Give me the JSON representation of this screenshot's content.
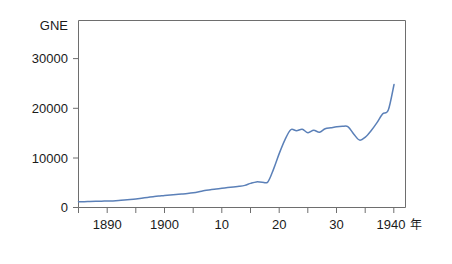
{
  "chart_data": {
    "type": "line",
    "title": "",
    "subtitle": "",
    "ylabel": "GNE",
    "xlabel": "年",
    "x_unit_label": "年",
    "xlim": [
      1885,
      1942
    ],
    "ylim": [
      0,
      38000
    ],
    "grid": false,
    "legend": null,
    "legend_position": "none",
    "y_ticks": [
      0,
      10000,
      20000,
      30000
    ],
    "y_tick_labels": [
      "0",
      "10000",
      "20000",
      "30000"
    ],
    "x_ticks": [
      1890,
      1895,
      1900,
      1905,
      1910,
      1915,
      1920,
      1925,
      1930,
      1935,
      1940
    ],
    "x_tick_labels": [
      "1890",
      "",
      "1900",
      "",
      "10",
      "",
      "20",
      "",
      "30",
      "",
      "1940"
    ],
    "x_labeled_ticks": [
      1890,
      1900,
      1910,
      1920,
      1930,
      1940
    ],
    "x_labeled_text": [
      "1890",
      "1900",
      "10",
      "20",
      "30",
      "1940"
    ],
    "line_color": "#5b80b8",
    "axis_color": "#6e6e6e",
    "series": [
      {
        "name": "GNE",
        "x": [
          1885,
          1886,
          1887,
          1888,
          1889,
          1890,
          1891,
          1892,
          1893,
          1894,
          1895,
          1896,
          1897,
          1898,
          1899,
          1900,
          1901,
          1902,
          1903,
          1904,
          1905,
          1906,
          1907,
          1908,
          1909,
          1910,
          1911,
          1912,
          1913,
          1914,
          1915,
          1916,
          1917,
          1918,
          1919,
          1920,
          1921,
          1922,
          1923,
          1924,
          1925,
          1926,
          1927,
          1928,
          1929,
          1930,
          1931,
          1932,
          1933,
          1934,
          1935,
          1936,
          1937,
          1938,
          1939,
          1940
        ],
        "values": [
          1150,
          1180,
          1220,
          1260,
          1290,
          1320,
          1340,
          1400,
          1500,
          1620,
          1750,
          1900,
          2050,
          2200,
          2320,
          2450,
          2550,
          2620,
          2720,
          2830,
          2980,
          3200,
          3450,
          3620,
          3780,
          3920,
          4050,
          4180,
          4300,
          4500,
          4900,
          5200,
          5150,
          5200,
          7800,
          11000,
          13800,
          15800,
          15600,
          15900,
          15200,
          15700,
          15300,
          16000,
          16200,
          16400,
          16500,
          16400,
          14900,
          13700,
          14300,
          15600,
          17200,
          19000,
          19800,
          25000
        ]
      }
    ],
    "annotations": []
  },
  "axis_labels": {
    "y_title": "GNE",
    "x_unit": "年"
  }
}
